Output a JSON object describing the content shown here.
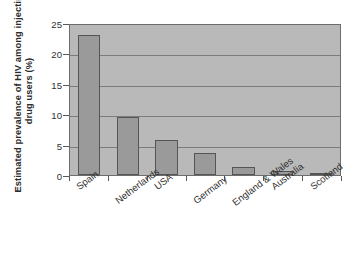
{
  "chart_data": {
    "type": "bar",
    "title": "",
    "xlabel": "",
    "ylabel_line1": "Estimated prevalence of HIV among injecting",
    "ylabel_line2": "drug users (%)",
    "categories": [
      "Spain",
      "Netherlands",
      "USA",
      "Germany",
      "England & Wales",
      "Australia",
      "Scotland"
    ],
    "values": [
      23.0,
      9.5,
      5.7,
      3.6,
      1.3,
      0.7,
      0.4
    ],
    "ylim": [
      0,
      25
    ],
    "yticks": [
      0,
      5,
      10,
      15,
      20,
      25
    ],
    "ytick_labels": [
      "0",
      "5",
      "10",
      "15",
      "20",
      "25"
    ],
    "grid": "horizontal",
    "legend": "none",
    "colors": {
      "bar_fill": "#9a9a9a",
      "bar_edge": "#555555",
      "plot_background": "#b9b9b9",
      "gridline": "#7c7c7c",
      "axis": "#6d6d6d",
      "text": "#303030",
      "page_background": "#ffffff"
    }
  }
}
